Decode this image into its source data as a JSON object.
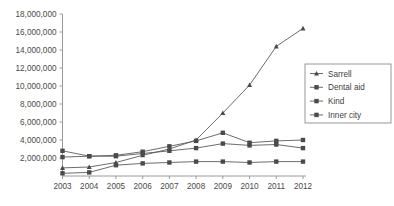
{
  "chart_data": {
    "type": "line",
    "title": "",
    "subtitle": "",
    "xlabel": "",
    "ylabel": "",
    "x": [
      2003,
      2004,
      2005,
      2006,
      2007,
      2008,
      2009,
      2010,
      2011,
      2012
    ],
    "xtick_labels": [
      "2003",
      "2004",
      "2005",
      "2006",
      "2007",
      "2008",
      "2009",
      "2010",
      "2011",
      "2012"
    ],
    "ytick_labels": [
      "2,000,000",
      "4,000,000",
      "6,000,000",
      "8,000,000",
      "10,000,000",
      "12,000,000",
      "14,000,000",
      "16,000,000",
      "18,000,000"
    ],
    "ytick_values": [
      2000000,
      4000000,
      6000000,
      8000000,
      10000000,
      12000000,
      14000000,
      16000000,
      18000000
    ],
    "ylim": [
      0,
      18000000
    ],
    "xlim": [
      2003,
      2012
    ],
    "grid": false,
    "legend_position": "right",
    "series": [
      {
        "name": "Sarrell",
        "marker": "triangle",
        "color": "#4a4a4a",
        "values": [
          900000,
          1000000,
          1500000,
          2300000,
          3000000,
          4000000,
          7000000,
          10100000,
          14400000,
          16400000
        ]
      },
      {
        "name": "Dental aid",
        "marker": "square",
        "color": "#4a4a4a",
        "values": [
          2100000,
          2200000,
          2300000,
          2700000,
          3300000,
          3900000,
          4800000,
          3700000,
          3900000,
          4000000
        ]
      },
      {
        "name": "Kind",
        "marker": "square",
        "color": "#4a4a4a",
        "values": [
          300000,
          400000,
          1200000,
          1400000,
          1500000,
          1600000,
          1600000,
          1500000,
          1600000,
          1600000
        ]
      },
      {
        "name": "Inner city",
        "marker": "square",
        "color": "#4a4a4a",
        "values": [
          2800000,
          2200000,
          2200000,
          2500000,
          2800000,
          3100000,
          3600000,
          3400000,
          3500000,
          3100000
        ]
      }
    ]
  }
}
